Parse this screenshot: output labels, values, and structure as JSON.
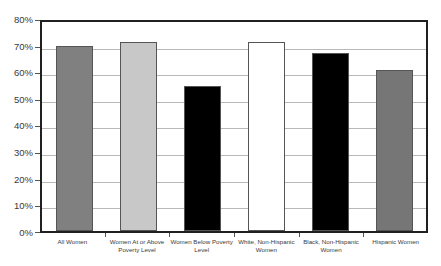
{
  "chart_data": {
    "type": "bar",
    "title": "",
    "subtitle": "",
    "xlabel": "",
    "ylabel": "",
    "categories": [
      "All Women",
      "Women At or Above Poverty Level",
      "Women Below Poverty Level",
      "White, Non-Hispanic Women",
      "Black, Non-Hispanic Women",
      "Hispanic Women"
    ],
    "values": [
      70.9,
      72.3,
      55.4,
      72.3,
      68.0,
      61.5
    ],
    "bar_colors": [
      "#808080",
      "#c8c8c8",
      "#000000",
      "#ffffff",
      "#000000",
      "#767676"
    ],
    "bar_border_color": "#555555",
    "ylim": [
      0,
      80
    ],
    "ytick_step": 10,
    "ytick_labels": [
      "80%",
      "70%",
      "60%",
      "50%",
      "40%",
      "30%",
      "20%",
      "10%",
      "0%"
    ],
    "ytick_values": [
      80,
      70,
      60,
      50,
      40,
      30,
      20,
      10,
      0
    ],
    "grid": true,
    "grid_axis": "y",
    "grid_color": "#b9b9b9",
    "legend": false,
    "legend_position": "none",
    "plot_border_color": "#202020",
    "background_color": "#ffffff"
  }
}
